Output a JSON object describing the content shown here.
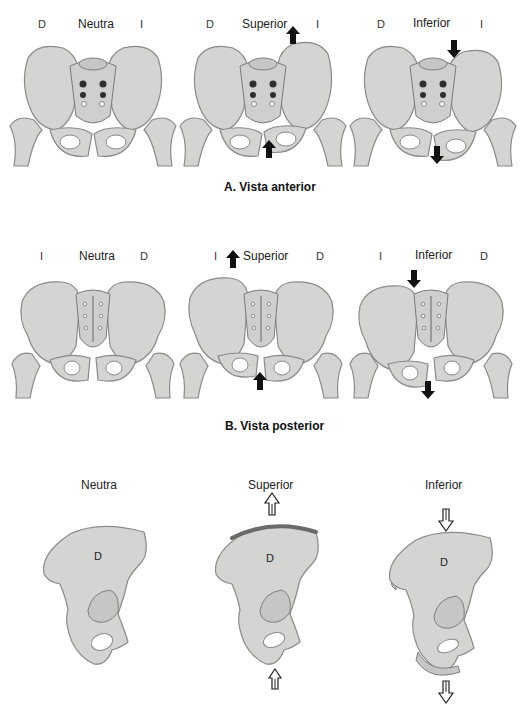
{
  "sections": [
    {
      "id": "anterior",
      "caption": "A. Vista anterior",
      "panels": [
        {
          "title": "Neutra",
          "left_side": "D",
          "right_side": "I",
          "arrows": []
        },
        {
          "title": "Superior",
          "left_side": "D",
          "right_side": "I",
          "arrows": [
            "up-left-iliac-crest",
            "up-pubis"
          ]
        },
        {
          "title": "Inferior",
          "left_side": "D",
          "right_side": "I",
          "arrows": [
            "down-left-iliac-crest",
            "down-pubis"
          ]
        }
      ]
    },
    {
      "id": "posterior",
      "caption": "B. Vista posterior",
      "panels": [
        {
          "title": "Neutra",
          "left_side": "I",
          "right_side": "D",
          "arrows": []
        },
        {
          "title": "Superior",
          "left_side": "I",
          "right_side": "D",
          "arrows": [
            "up-left-iliac-crest",
            "up-pubis"
          ]
        },
        {
          "title": "Inferior",
          "left_side": "I",
          "right_side": "D",
          "arrows": [
            "down-left-iliac-crest",
            "down-pubis"
          ]
        }
      ]
    },
    {
      "id": "lateral",
      "caption": "",
      "panels": [
        {
          "title": "Neutra",
          "bone_label": "D",
          "arrows": []
        },
        {
          "title": "Superior",
          "bone_label": "D",
          "arrows": [
            "open-up-top",
            "open-up-bottom"
          ]
        },
        {
          "title": "Inferior",
          "bone_label": "D",
          "arrows": [
            "open-down-top",
            "open-down-bottom"
          ]
        }
      ]
    }
  ],
  "colors": {
    "bone": "#d4d4d2",
    "bone_outline": "#8a8a88",
    "arrow": "#111111",
    "background": "#ffffff"
  }
}
